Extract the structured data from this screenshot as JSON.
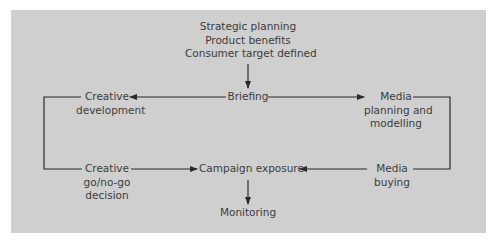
{
  "diagram": {
    "background_color": "#cfcfcf",
    "line_color": "#2a2a2a",
    "text_color": "#3c3c3c",
    "nodes": {
      "inputs": {
        "lines": [
          "Strategic planning",
          "Product benefits",
          "Consumer target defined"
        ]
      },
      "briefing": {
        "lines": [
          "Briefing"
        ]
      },
      "creative_development": {
        "lines": [
          "Creative",
          "development"
        ]
      },
      "media_planning": {
        "lines": [
          "Media",
          "planning and",
          "modelling"
        ]
      },
      "creative_decision": {
        "lines": [
          "Creative",
          "go/no-go",
          "decision"
        ]
      },
      "campaign_exposure": {
        "lines": [
          "Campaign exposure"
        ]
      },
      "media_buying": {
        "lines": [
          "Media",
          "buying"
        ]
      },
      "monitoring": {
        "lines": [
          "Monitoring"
        ]
      }
    },
    "edges": [
      {
        "from": "inputs",
        "to": "briefing"
      },
      {
        "from": "briefing",
        "to": "creative_development"
      },
      {
        "from": "briefing",
        "to": "media_planning"
      },
      {
        "from": "creative_development",
        "to": "creative_decision"
      },
      {
        "from": "media_planning",
        "to": "media_buying"
      },
      {
        "from": "creative_decision",
        "to": "campaign_exposure"
      },
      {
        "from": "media_buying",
        "to": "campaign_exposure"
      },
      {
        "from": "campaign_exposure",
        "to": "monitoring"
      }
    ]
  }
}
